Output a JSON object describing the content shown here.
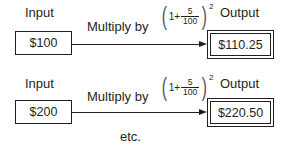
{
  "rows": [
    {
      "input_label": "Input",
      "input_value": "$100",
      "operation_label": "Multiply by",
      "formula": {
        "one": "1+",
        "numerator": "5",
        "denominator": "100",
        "exponent": "2"
      },
      "output_label": "Output",
      "output_value": "$110.25"
    },
    {
      "input_label": "Input",
      "input_value": "$200",
      "operation_label": "Multiply by",
      "formula": {
        "one": "1+",
        "numerator": "5",
        "denominator": "100",
        "exponent": "2"
      },
      "output_label": "Output",
      "output_value": "$220.50"
    }
  ],
  "footer": "etc."
}
